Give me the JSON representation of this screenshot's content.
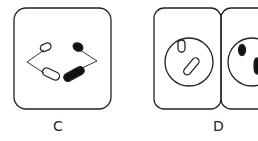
{
  "figures": [
    {
      "id": "C",
      "label": "C",
      "description": "plug with connected prongs"
    },
    {
      "id": "D",
      "label": "D",
      "description": "outlet panels"
    }
  ],
  "colors": {
    "stroke": "#222222",
    "fill": "#111111",
    "background": "#ffffff"
  }
}
